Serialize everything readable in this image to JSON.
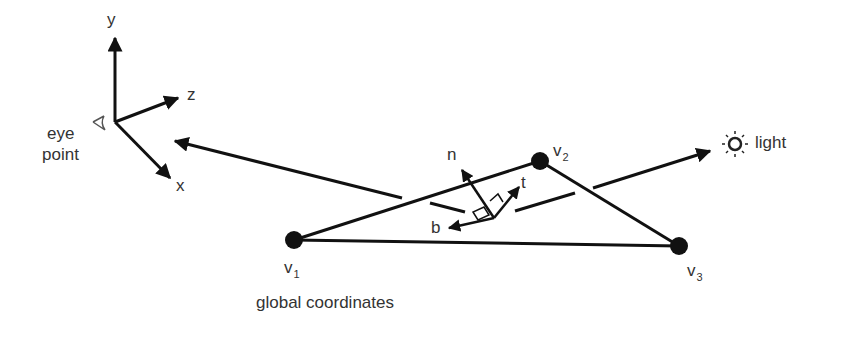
{
  "diagram": {
    "caption": "global coordinates",
    "axes": {
      "y": "y",
      "z": "z",
      "x": "x"
    },
    "eye_label_line1": "eye",
    "eye_label_line2": "point",
    "light_label": "light",
    "vectors": {
      "n": "n",
      "t": "t",
      "b": "b"
    },
    "vertices": [
      {
        "base": "v",
        "sub": "1"
      },
      {
        "base": "v",
        "sub": "2"
      },
      {
        "base": "v",
        "sub": "3"
      }
    ],
    "icons": [
      "eye-icon",
      "sun-icon"
    ],
    "colors": {
      "stroke": "#111111",
      "text": "#333333",
      "background": "#ffffff"
    }
  }
}
